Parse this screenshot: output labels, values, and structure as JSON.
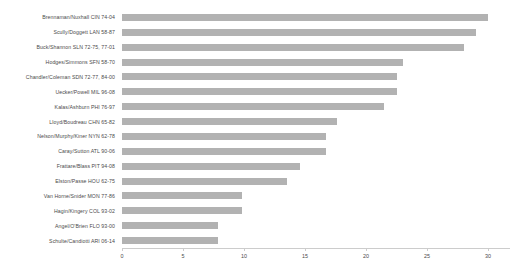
{
  "chart_data": {
    "type": "bar",
    "orientation": "horizontal",
    "title": "",
    "subtitle": "",
    "xlabel": "",
    "ylabel": "",
    "xlim": [
      0,
      31.8
    ],
    "ylim": null,
    "grid": false,
    "legend": null,
    "bar_color": "#b2b2b2",
    "axis_color": "#cccccc",
    "text_color": "#4a4a4a",
    "xticks": [
      0,
      5,
      10,
      15,
      20,
      25,
      30
    ],
    "xtick_labels": [
      "0",
      "5",
      "10",
      "15",
      "20",
      "25",
      "30"
    ],
    "categories": [
      "Brennaman/Nuxhall CIN 74-04",
      "Scully/Doggett LAN 58-87",
      "Buck/Shannon SLN 72-75, 77-01",
      "Hodges/Simmons SFN 58-70",
      "Chandler/Coleman SDN 72-77, 84-00",
      "Uecker/Powell MIL 96-08",
      "Kalas/Ashburn PHI 76-97",
      "Lloyd/Boudreau CHN 65-82",
      "Nelson/Murphy/Kiner NYN 62-78",
      "Caray/Sutton ATL 90-06",
      "Frattare/Blass PIT 94-08",
      "Elston/Passe HOU 62-75",
      "Van Horne/Snider MON 77-86",
      "Hagin/Kingery COL 93-02",
      "Angel/O'Brien FLO 93-00",
      "Schulte/Candiotti ARI 06-14"
    ],
    "values": [
      30,
      29,
      28,
      23,
      22.5,
      22.5,
      21.5,
      17.6,
      16.7,
      16.7,
      14.6,
      13.5,
      9.8,
      9.8,
      7.9,
      7.9
    ]
  }
}
